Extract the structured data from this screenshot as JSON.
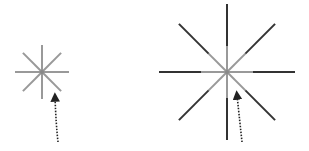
{
  "diagram": {
    "colors": {
      "background": "#ffffff",
      "inner_ray": "#999999",
      "outer_ray": "#333333",
      "arrow": "#222222"
    },
    "figures": [
      {
        "name": "small-starburst",
        "center": [
          42,
          72
        ],
        "ray_length": 27,
        "rays": 8,
        "inner_length": 27,
        "arrow": {
          "from": [
            58,
            142
          ],
          "to": [
            55,
            97
          ]
        }
      },
      {
        "name": "large-starburst",
        "center": [
          227,
          72
        ],
        "ray_length": 68,
        "rays": 8,
        "inner_length": 26,
        "arrow": {
          "from": [
            242,
            142
          ],
          "to": [
            237,
            95
          ]
        }
      }
    ]
  }
}
